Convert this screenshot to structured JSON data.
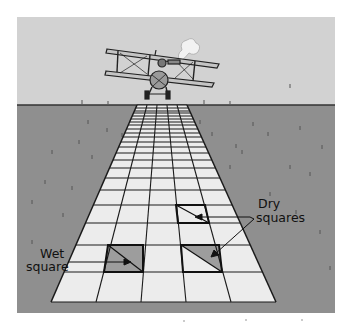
{
  "figure": {
    "labels": {
      "wet_line1": "Wet",
      "wet_line2": "square",
      "dry_line1": "Dry",
      "dry_line2": "squares"
    },
    "colors": {
      "sky": "#d2d2d2",
      "ground": "#8f8f8f",
      "runway": "#ececec",
      "grid_line": "#1a1a1a",
      "shaded": "#9d9d9d",
      "background": "#ffffff"
    },
    "runway": {
      "columns": 5,
      "top_left": [
        137,
        105
      ],
      "top_right": [
        187,
        105
      ],
      "bottom_left": [
        51,
        302
      ],
      "bottom_right": [
        276,
        302
      ],
      "row_lines_y": [
        105,
        108,
        111,
        113,
        116,
        119,
        122,
        125,
        129,
        133,
        137,
        142,
        147,
        153,
        160,
        168,
        178,
        190,
        205,
        223,
        245,
        272,
        302
      ]
    },
    "highlighted_squares": [
      {
        "label": "wet",
        "column": 1,
        "row_top": 245,
        "row_bottom": 272,
        "shading": "full"
      },
      {
        "label": "dry",
        "column": 3,
        "row_top": 245,
        "row_bottom": 272,
        "shading": "upper-right-triangle"
      },
      {
        "label": "dry",
        "column": 3,
        "row_top": 205,
        "row_bottom": 223,
        "shading": "none"
      }
    ]
  }
}
